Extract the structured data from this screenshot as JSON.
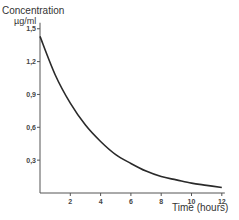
{
  "chart_data": {
    "type": "line",
    "title": "",
    "ylabel": "Concentration",
    "ylabel_unit": "µg/ml",
    "xlabel": "Time (hours)",
    "xlim": [
      0,
      12.2
    ],
    "ylim": [
      0,
      1.5
    ],
    "xticks": [
      2,
      4,
      6,
      8,
      10,
      12
    ],
    "xtick_labels": [
      "2",
      "4",
      "6",
      "8",
      "10",
      "12"
    ],
    "yticks": [
      0.3,
      0.6,
      0.9,
      1.2,
      1.5
    ],
    "ytick_labels": [
      "0,3",
      "0,6",
      "0,9",
      "1,2",
      "1,5"
    ],
    "grid": false,
    "legend": null,
    "series": [
      {
        "name": "Concentration",
        "description": "Exponential decay curve",
        "color": "#2a2a2a",
        "x": [
          0,
          1,
          2,
          3,
          4,
          5,
          6,
          7,
          8,
          9,
          10,
          11,
          12
        ],
        "values": [
          1.43,
          1.08,
          0.82,
          0.62,
          0.47,
          0.35,
          0.27,
          0.2,
          0.15,
          0.12,
          0.09,
          0.07,
          0.05
        ]
      }
    ]
  },
  "labels": {
    "y_title": "Concentration",
    "y_unit": "µg/ml",
    "x_title": "Time (hours)"
  }
}
